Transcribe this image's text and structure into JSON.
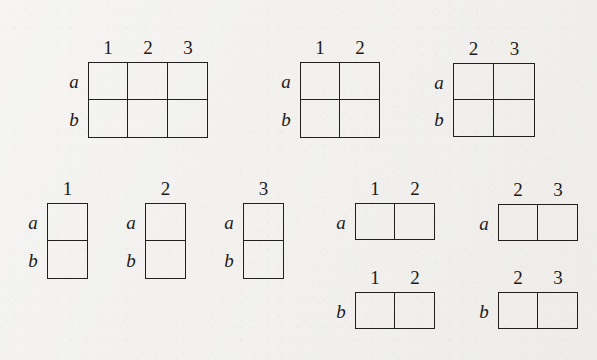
{
  "figure": {
    "kind": "young-tableaux-diagram",
    "background_color": "#f2f1ee",
    "ink_color": "#231f1e",
    "row_label_a": "a",
    "row_label_b": "b",
    "column_numbers": [
      "1",
      "2",
      "3"
    ]
  },
  "tableaux": [
    {
      "id": "tableau-a-b-123",
      "columns": [
        "1",
        "2",
        "3"
      ],
      "rows": [
        "a",
        "b"
      ],
      "n_cols": 3,
      "n_rows": 2,
      "x": 88,
      "y": 62,
      "cell_w": 40,
      "cell_h": 38
    },
    {
      "id": "tableau-a-b-12",
      "columns": [
        "1",
        "2"
      ],
      "rows": [
        "a",
        "b"
      ],
      "n_cols": 2,
      "n_rows": 2,
      "x": 300,
      "y": 62,
      "cell_w": 40,
      "cell_h": 38
    },
    {
      "id": "tableau-a-b-23",
      "columns": [
        "2",
        "3"
      ],
      "rows": [
        "a",
        "b"
      ],
      "n_cols": 2,
      "n_rows": 2,
      "x": 453,
      "y": 63,
      "cell_w": 41,
      "cell_h": 37
    },
    {
      "id": "tableau-a-b-1",
      "columns": [
        "1"
      ],
      "rows": [
        "a",
        "b"
      ],
      "n_cols": 1,
      "n_rows": 2,
      "x": 47,
      "y": 203,
      "cell_w": 41,
      "cell_h": 38
    },
    {
      "id": "tableau-a-b-2",
      "columns": [
        "2"
      ],
      "rows": [
        "a",
        "b"
      ],
      "n_cols": 1,
      "n_rows": 2,
      "x": 145,
      "y": 203,
      "cell_w": 41,
      "cell_h": 38
    },
    {
      "id": "tableau-a-b-3",
      "columns": [
        "3"
      ],
      "rows": [
        "a",
        "b"
      ],
      "n_cols": 1,
      "n_rows": 2,
      "x": 243,
      "y": 203,
      "cell_w": 41,
      "cell_h": 38
    },
    {
      "id": "tableau-a-12",
      "columns": [
        "1",
        "2"
      ],
      "rows": [
        "a"
      ],
      "n_cols": 2,
      "n_rows": 1,
      "x": 355,
      "y": 203,
      "cell_w": 40,
      "cell_h": 37
    },
    {
      "id": "tableau-a-23",
      "columns": [
        "2",
        "3"
      ],
      "rows": [
        "a"
      ],
      "n_cols": 2,
      "n_rows": 1,
      "x": 498,
      "y": 204,
      "cell_w": 40,
      "cell_h": 37
    },
    {
      "id": "tableau-b-12",
      "columns": [
        "1",
        "2"
      ],
      "rows": [
        "b"
      ],
      "n_cols": 2,
      "n_rows": 1,
      "x": 355,
      "y": 292,
      "cell_w": 40,
      "cell_h": 37
    },
    {
      "id": "tableau-b-23",
      "columns": [
        "2",
        "3"
      ],
      "rows": [
        "b"
      ],
      "n_cols": 2,
      "n_rows": 1,
      "x": 498,
      "y": 292,
      "cell_w": 40,
      "cell_h": 37
    }
  ]
}
